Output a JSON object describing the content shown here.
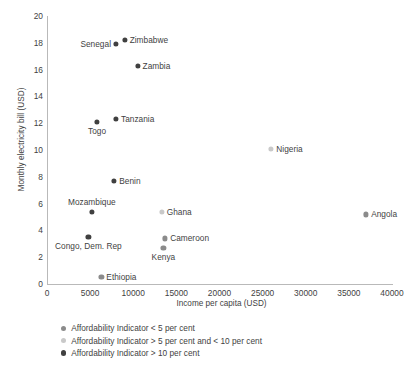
{
  "chart_data": {
    "type": "scatter",
    "title": "",
    "xlabel": "Income per capita (USD)",
    "ylabel": "Monthly electricity bill (USD)",
    "xlim": [
      0,
      40000
    ],
    "ylim": [
      0,
      20
    ],
    "xticks": [
      "0",
      "5000",
      "10000",
      "15000",
      "20000",
      "25000",
      "30000",
      "35000",
      "40000"
    ],
    "xtick_values": [
      0,
      5000,
      10000,
      15000,
      20000,
      25000,
      30000,
      35000,
      40000
    ],
    "yticks": [
      "0",
      "2",
      "4",
      "6",
      "8",
      "10",
      "12",
      "14",
      "16",
      "18",
      "20"
    ],
    "ytick_values": [
      0,
      2,
      4,
      6,
      8,
      10,
      12,
      14,
      16,
      18,
      20
    ],
    "grid": false,
    "legend_position": "below-axis-left",
    "colors": {
      "series_lt5": "#8b8b8b",
      "series_5to10": "#c9c9c9",
      "series_gt10": "#404040",
      "axis": "#b9b9b9",
      "text": "#3f3f3f"
    },
    "series": [
      {
        "name": "Affordability Indicator < 5 per cent",
        "color": "#8b8b8b",
        "points": [
          {
            "label": "Angola",
            "x": 37000,
            "y": 5.2,
            "label_pos": "right"
          },
          {
            "label": "Cameroon",
            "x": 13700,
            "y": 3.4,
            "label_pos": "right"
          },
          {
            "label": "Kenya",
            "x": 13500,
            "y": 2.7,
            "label_pos": "below"
          },
          {
            "label": "Ethiopia",
            "x": 6300,
            "y": 0.5,
            "label_pos": "right"
          }
        ]
      },
      {
        "name": "Affordability Indicator > 5 per cent and < 10 per cent",
        "color": "#c9c9c9",
        "points": [
          {
            "label": "Nigeria",
            "x": 26000,
            "y": 10.1,
            "label_pos": "right"
          },
          {
            "label": "Ghana",
            "x": 13300,
            "y": 5.4,
            "label_pos": "right"
          }
        ]
      },
      {
        "name": "Affordability Indicator > 10 per cent",
        "color": "#404040",
        "points": [
          {
            "label": "Zimbabwe",
            "x": 9000,
            "y": 18.2,
            "label_pos": "right"
          },
          {
            "label": "Senegal",
            "x": 8000,
            "y": 17.9,
            "label_pos": "left"
          },
          {
            "label": "Zambia",
            "x": 10500,
            "y": 16.3,
            "label_pos": "right"
          },
          {
            "label": "Tanzania",
            "x": 8000,
            "y": 12.3,
            "label_pos": "right"
          },
          {
            "label": "Togo",
            "x": 5800,
            "y": 12.1,
            "label_pos": "below"
          },
          {
            "label": "Benin",
            "x": 7800,
            "y": 7.7,
            "label_pos": "right"
          },
          {
            "label": "Mozambique",
            "x": 5200,
            "y": 5.4,
            "label_pos": "above"
          },
          {
            "label": "Congo, Dem. Rep",
            "x": 4800,
            "y": 3.5,
            "label_pos": "below"
          }
        ]
      }
    ]
  },
  "legend": {
    "items": [
      {
        "label": "Affordability Indicator < 5 per cent",
        "color": "#8b8b8b"
      },
      {
        "label": "Affordability Indicator > 5 per cent and < 10 per cent",
        "color": "#c9c9c9"
      },
      {
        "label": "Affordability Indicator > 10 per cent",
        "color": "#404040"
      }
    ]
  }
}
